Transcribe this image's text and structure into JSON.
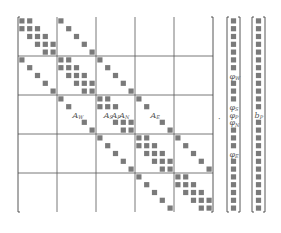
{
  "diagram": {
    "title": "",
    "matrix": {
      "blocks": 5,
      "block_size": 5,
      "cell_color": "#7a7a7a",
      "line_color": "#555555",
      "stencil_offsets": [
        -5,
        -1,
        0,
        1,
        5
      ],
      "highlight_row": 12,
      "labels": [
        {
          "col": 7,
          "base": "A",
          "sub": "W"
        },
        {
          "col": 11,
          "base": "A",
          "sub": "S"
        },
        {
          "col": 12,
          "base": "A",
          "sub": "P"
        },
        {
          "col": 13,
          "base": "A",
          "sub": "N"
        },
        {
          "col": 17,
          "base": "A",
          "sub": "E"
        }
      ]
    },
    "operator": "·",
    "unknown_vector": {
      "rows": 25,
      "labels": [
        {
          "row": 7,
          "base": "φ",
          "sub": "W"
        },
        {
          "row": 11,
          "base": "φ",
          "sub": "S"
        },
        {
          "row": 12,
          "base": "φ",
          "sub": "P"
        },
        {
          "row": 13,
          "base": "φ",
          "sub": "N"
        },
        {
          "row": 17,
          "base": "φ",
          "sub": "E"
        }
      ]
    },
    "rhs_vector": {
      "rows": 25,
      "labels": [
        {
          "row": 12,
          "base": "b",
          "sub": "P"
        }
      ]
    }
  }
}
